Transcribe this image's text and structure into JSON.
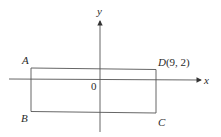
{
  "diagram": {
    "axes": {
      "x_label": "x",
      "y_label": "y",
      "origin_label": "0"
    },
    "rectangle": {
      "vertices": {
        "A": {
          "label": "A"
        },
        "B": {
          "label": "B"
        },
        "C": {
          "label": "C"
        },
        "D": {
          "label": "D",
          "coords": "(9, 2)"
        }
      }
    },
    "colors": {
      "line": "#555555",
      "text": "#2a2a2a",
      "background": "#ffffff"
    }
  }
}
